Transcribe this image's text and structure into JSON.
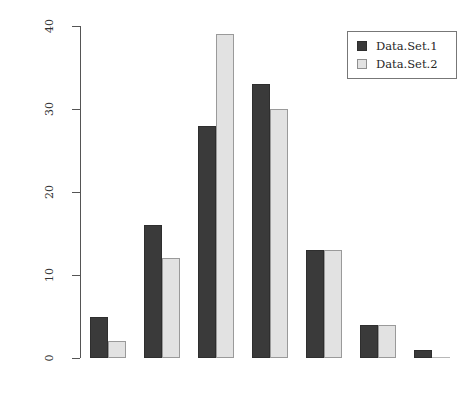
{
  "chart_data": {
    "type": "bar",
    "title": "",
    "subtitle": "",
    "xlabel": "",
    "ylabel": "Number of Domains",
    "ylim": [
      0,
      40
    ],
    "yticks": [
      0,
      10,
      20,
      30,
      40
    ],
    "ytick_labels": [
      "0",
      "10",
      "20",
      "30",
      "40"
    ],
    "grid": false,
    "legend_position": "top-right",
    "categories": [
      "1",
      "2",
      "3",
      "4",
      "5",
      "6",
      "7"
    ],
    "xtick_labels": [
      "",
      "",
      "",
      "",
      "",
      "",
      ""
    ],
    "series": [
      {
        "name": "Data.Set.1",
        "color": "#3a3a3a",
        "values": [
          5,
          16,
          28,
          33,
          13,
          4,
          1
        ]
      },
      {
        "name": "Data.Set.2",
        "color": "#e2e2e2",
        "values": [
          2,
          12,
          39,
          30,
          13,
          4,
          0
        ]
      }
    ]
  },
  "legend": {
    "items": [
      {
        "label": "Data.Set.1",
        "swatch": "dark-square-swatch"
      },
      {
        "label": "Data.Set.2",
        "swatch": "light-square-swatch"
      }
    ]
  },
  "axes": {
    "y_label": "Number of Domains"
  },
  "colors": {
    "series_1": "#3a3a3a",
    "series_2": "#e2e2e2",
    "axis": "#555555",
    "text": "#333333",
    "background": "#ffffff"
  }
}
